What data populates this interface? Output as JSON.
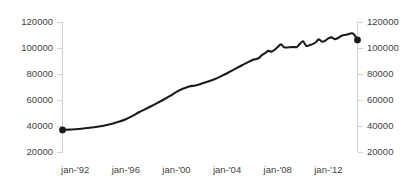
{
  "chart_data": {
    "type": "line",
    "title": "",
    "subtitle": "",
    "xlabel": "",
    "ylabel": "",
    "grid": false,
    "legend": null,
    "ylim": [
      20000,
      120000
    ],
    "y_ticks": [
      20000,
      40000,
      60000,
      80000,
      100000,
      120000
    ],
    "y_tick_labels_left": [
      "20000",
      "40000",
      "60000",
      "80000",
      "100000",
      "120000"
    ],
    "y_tick_labels_right": [
      "20000",
      "40000",
      "60000",
      "80000",
      "100000",
      "120000"
    ],
    "dual_axis": true,
    "x_tick_labels": [
      "jan-'92",
      "jan-'96",
      "jan-'00",
      "jan-'04",
      "jan-'08",
      "jan-'12"
    ],
    "x_tick_values": [
      1992,
      1996,
      2000,
      2004,
      2008,
      2012
    ],
    "xlim": [
      1991.0,
      2014.3
    ],
    "series": [
      {
        "name": "series-1",
        "markers_at_endpoints": true,
        "color": "#1b1b1b",
        "x": [
          1991.0,
          1991.5,
          1992.0,
          1992.5,
          1993.0,
          1993.5,
          1994.0,
          1994.5,
          1995.0,
          1995.5,
          1996.0,
          1996.5,
          1997.0,
          1997.5,
          1998.0,
          1998.5,
          1999.0,
          1999.5,
          2000.0,
          2000.5,
          2001.0,
          2001.5,
          2002.0,
          2002.5,
          2003.0,
          2003.5,
          2004.0,
          2004.5,
          2005.0,
          2005.5,
          2006.0,
          2006.25,
          2006.5,
          2006.75,
          2007.0,
          2007.25,
          2007.5,
          2007.75,
          2008.0,
          2008.25,
          2008.5,
          2008.75,
          2009.0,
          2009.25,
          2009.5,
          2009.75,
          2010.0,
          2010.25,
          2010.5,
          2010.75,
          2011.0,
          2011.25,
          2011.5,
          2011.75,
          2012.0,
          2012.25,
          2012.5,
          2012.75,
          2013.0,
          2013.25,
          2013.5,
          2013.75,
          2014.0,
          2014.3
        ],
        "y": [
          37000,
          37200,
          37500,
          37900,
          38400,
          39000,
          39800,
          40800,
          42000,
          43400,
          45200,
          47600,
          50400,
          52800,
          55200,
          57800,
          60400,
          63200,
          66200,
          68600,
          70400,
          71200,
          72600,
          74200,
          76000,
          78200,
          80600,
          83200,
          85800,
          88400,
          90800,
          91400,
          92200,
          94600,
          96000,
          97800,
          97200,
          98600,
          100800,
          102800,
          100600,
          100400,
          100600,
          100800,
          100700,
          103200,
          105200,
          101600,
          102200,
          103000,
          104400,
          106600,
          104800,
          105600,
          107400,
          108200,
          106800,
          107600,
          109200,
          110000,
          110400,
          111200,
          110800,
          106200
        ]
      }
    ]
  },
  "axes": {
    "left_axis_name": "left-value-axis",
    "right_axis_name": "right-value-axis",
    "bottom_axis_name": "time-axis"
  }
}
